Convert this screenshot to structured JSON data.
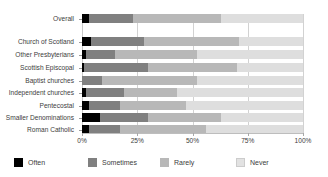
{
  "chart_data": {
    "type": "bar",
    "orientation": "horizontal",
    "stacked": true,
    "stack_normalized": true,
    "title": "",
    "xlabel": "",
    "ylabel": "",
    "xlim": [
      0,
      100
    ],
    "xticks": [
      0,
      25,
      50,
      75,
      100
    ],
    "xtick_labels": [
      "0%",
      "25%",
      "50%",
      "75%",
      "100%"
    ],
    "grid": true,
    "grid_axis": "x",
    "legend_position": "bottom",
    "categories": [
      "Overall",
      "Church of Scotland",
      "Other Presbyterians",
      "Scottish Episcopal",
      "Baptist churches",
      "Independent churches",
      "Pentecostal",
      "Smaller Denominations",
      "Roman Catholic"
    ],
    "series": [
      {
        "name": "Often",
        "color": "#000000",
        "values": [
          3,
          4,
          2,
          1,
          0,
          2,
          3,
          8,
          3
        ]
      },
      {
        "name": "Sometimes",
        "color": "#808080",
        "values": [
          20,
          24,
          13,
          29,
          9,
          17,
          14,
          22,
          14
        ]
      },
      {
        "name": "Rarely",
        "color": "#b8b8b8",
        "values": [
          40,
          43,
          37,
          40,
          43,
          24,
          30,
          33,
          39
        ]
      },
      {
        "name": "Never",
        "color": "#dedede",
        "values": [
          37,
          29,
          48,
          30,
          48,
          57,
          53,
          37,
          44
        ]
      }
    ]
  },
  "legend": {
    "items": [
      {
        "label": "Often",
        "swatch": "often-swatch"
      },
      {
        "label": "Sometimes",
        "swatch": "sometimes-swatch"
      },
      {
        "label": "Rarely",
        "swatch": "rarely-swatch"
      },
      {
        "label": "Never",
        "swatch": "never-swatch"
      }
    ]
  },
  "axis": {
    "ticks": [
      {
        "label": "0%",
        "value": 0
      },
      {
        "label": "25%",
        "value": 25
      },
      {
        "label": "50%",
        "value": 50
      },
      {
        "label": "75%",
        "value": 75
      },
      {
        "label": "100%",
        "value": 100
      }
    ]
  },
  "colors": {
    "often": "#000000",
    "sometimes": "#808080",
    "rarely": "#b8b8b8",
    "never": "#dedede",
    "gridline": "#d2d2d2",
    "axis": "#bdbdbd",
    "text": "#3d3d3d"
  }
}
